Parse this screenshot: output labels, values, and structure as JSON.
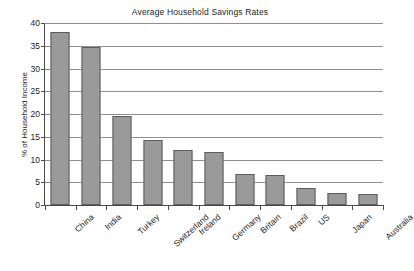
{
  "chart_data": {
    "type": "bar",
    "title": "Average Household Savings Rates",
    "xlabel": "",
    "ylabel": "% of Household Income",
    "categories": [
      "China",
      "India",
      "Turkey",
      "Switzerland",
      "Ireland",
      "Germany",
      "Britain",
      "Brazil",
      "US",
      "Japan",
      "Australia"
    ],
    "values": [
      38.0,
      34.8,
      19.5,
      14.3,
      12.2,
      11.7,
      6.9,
      6.7,
      3.8,
      2.6,
      2.4
    ],
    "ylim": [
      0,
      40
    ],
    "ytick_labels": [
      "0",
      "5",
      "10",
      "15",
      "20",
      "25",
      "30",
      "35",
      "40"
    ],
    "ytick_values": [
      0,
      5,
      10,
      15,
      20,
      25,
      30,
      35,
      40
    ],
    "grid": true,
    "legend": false,
    "legend_position": "none",
    "bar_fill_color": "#9a9a9a",
    "bar_edge_color": "#5c5c5c",
    "gridline_color": "#8e8e8e",
    "axis_color": "#4a4a4a",
    "background_color": "#ffffff",
    "text_color": "#1d1d1d"
  }
}
